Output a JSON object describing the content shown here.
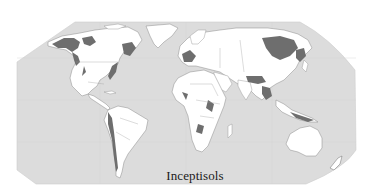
{
  "map": {
    "title": "Inceptisols",
    "projection": "world-map",
    "legend_label": "Inceptisols",
    "colors": {
      "ocean": "#dcdcdc",
      "land": "#ffffff",
      "inceptisols": "#6e6e6e",
      "borders": "#9a9a9a",
      "background": "#ffffff"
    },
    "regions": [
      {
        "name": "north-america"
      },
      {
        "name": "greenland"
      },
      {
        "name": "south-america"
      },
      {
        "name": "europe"
      },
      {
        "name": "africa"
      },
      {
        "name": "asia"
      },
      {
        "name": "southeast-asia-islands"
      },
      {
        "name": "australia"
      },
      {
        "name": "new-zealand"
      }
    ]
  }
}
